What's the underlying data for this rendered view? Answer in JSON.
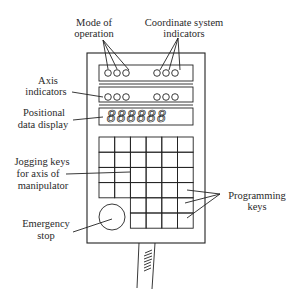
{
  "diagram": {
    "labels": {
      "mode_of_operation": [
        "Mode of",
        "operation"
      ],
      "coordinate_system": [
        "Coordinate system",
        "indicators"
      ],
      "axis_indicators": [
        "Axis",
        "indicators"
      ],
      "positional_display": [
        "Positional",
        "data display"
      ],
      "jogging_keys": [
        "Jogging keys",
        "for axis of",
        "manipulator"
      ],
      "programming_keys": [
        "Programming",
        "keys"
      ],
      "emergency_stop": [
        "Emergency",
        "stop"
      ]
    },
    "display_readout": "888888",
    "indicator_rows": [
      {
        "name": "mode-and-coordinate",
        "left_count": 3,
        "right_count": 3
      },
      {
        "name": "axis",
        "left_count": 3,
        "right_count": 3
      }
    ],
    "keypad": {
      "columns": 6,
      "jog_rows": 4,
      "programming_rows": 2,
      "programming_columns": 4
    },
    "colors": {
      "line": "#222222",
      "text": "#2a2a2a",
      "background": "#ffffff"
    }
  }
}
